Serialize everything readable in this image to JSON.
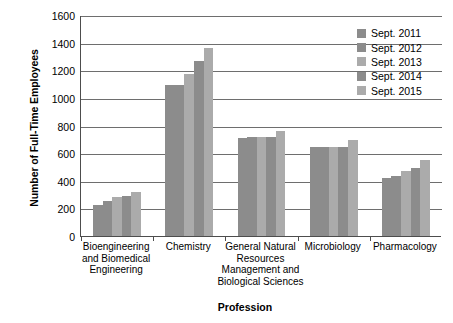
{
  "chart_data": {
    "type": "bar",
    "title": "",
    "xlabel": "Profession",
    "ylabel": "Number of Full-Time Employees",
    "ylim": [
      0,
      1600
    ],
    "ytick_step": 200,
    "yticks": [
      0,
      200,
      400,
      600,
      800,
      1000,
      1200,
      1400,
      1600
    ],
    "ytick_labels": [
      "0",
      "200",
      "400",
      "600",
      "800",
      "1000",
      "1200",
      "1400",
      "1600"
    ],
    "grid": "horizontal",
    "legend_position": "top-right",
    "categories": [
      "Bioengineering and Biomedical Engineering",
      "Chemistry",
      "General Natural Resources Management and Biological Sciences",
      "Microbiology",
      "Pharmacology"
    ],
    "category_lines": [
      [
        "Bioengineering",
        "and Biomedical",
        "Engineering"
      ],
      [
        "Chemistry"
      ],
      [
        "General Natural",
        "Resources",
        "Management and",
        "Biological Sciences"
      ],
      [
        "Microbiology"
      ],
      [
        "Pharmacology"
      ]
    ],
    "series": [
      {
        "name": "Sept. 2011",
        "color": "#8c8c8c",
        "values": [
          225,
          1090,
          710,
          645,
          420
        ]
      },
      {
        "name": "Sept. 2012",
        "color": "#8c8c8c",
        "values": [
          250,
          1090,
          720,
          645,
          435
        ]
      },
      {
        "name": "Sept. 2013",
        "color": "#ababab",
        "values": [
          280,
          1170,
          715,
          645,
          470
        ]
      },
      {
        "name": "Sept. 2014",
        "color": "#8c8c8c",
        "values": [
          290,
          1270,
          720,
          645,
          495
        ]
      },
      {
        "name": "Sept. 2015",
        "color": "#ababab",
        "values": [
          320,
          1360,
          760,
          695,
          550
        ]
      }
    ]
  },
  "legend": {
    "items": [
      {
        "label": "Sept. 2011",
        "color": "#8c8c8c"
      },
      {
        "label": "Sept. 2012",
        "color": "#8c8c8c"
      },
      {
        "label": "Sept. 2013",
        "color": "#ababab"
      },
      {
        "label": "Sept. 2014",
        "color": "#8c8c8c"
      },
      {
        "label": "Sept. 2015",
        "color": "#ababab"
      }
    ]
  },
  "colors": {
    "axis": "#4d4d4d",
    "gridline": "#6e6e6e",
    "background": "#ffffff",
    "text": "#000000"
  }
}
